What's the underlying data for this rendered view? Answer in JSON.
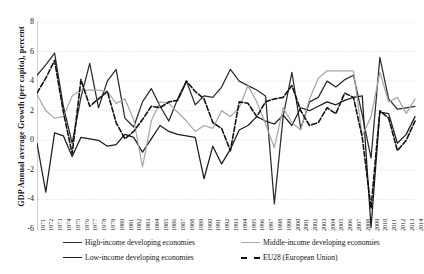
{
  "chart_data": {
    "type": "line",
    "title": "",
    "xlabel": "",
    "ylabel": "GDP Annual average Growth (per capita), percent",
    "ylim": [
      -6,
      8
    ],
    "yticks": [
      8,
      6,
      4,
      2,
      0,
      -2,
      -4,
      -6
    ],
    "grid": true,
    "legend_position": "bottom",
    "x": [
      1971,
      1972,
      1973,
      1974,
      1975,
      1976,
      1977,
      1978,
      1979,
      1980,
      1981,
      1982,
      1983,
      1984,
      1985,
      1986,
      1987,
      1988,
      1989,
      1990,
      1991,
      1992,
      1993,
      1994,
      1995,
      1996,
      1997,
      1998,
      1999,
      2000,
      2001,
      2002,
      2003,
      2004,
      2005,
      2006,
      2007,
      2008,
      2009,
      2010,
      2011,
      2012,
      2013,
      2014
    ],
    "series": [
      {
        "name": "High-income developing economies",
        "color": "#2b2b2b",
        "style": "solid",
        "values": [
          4.4,
          5.1,
          5.9,
          2.3,
          -0.2,
          2.9,
          5.2,
          2.2,
          4.0,
          4.8,
          1.5,
          0.9,
          2.6,
          3.5,
          2.3,
          1.3,
          2.8,
          4.0,
          2.4,
          3.0,
          2.9,
          3.6,
          4.8,
          4.0,
          3.7,
          3.4,
          3.0,
          -4.3,
          1.6,
          4.6,
          0.8,
          2.6,
          2.9,
          4.0,
          3.6,
          4.1,
          4.4,
          1.7,
          -1.2,
          5.6,
          2.8,
          2.1,
          2.2,
          2.3
        ]
      },
      {
        "name": "Low-income developing economies",
        "color": "#1c1c1c",
        "style": "solid",
        "values": [
          -0.2,
          -3.5,
          0.5,
          0.3,
          -1.1,
          0.2,
          0.1,
          0.0,
          -0.4,
          -0.3,
          0.4,
          0.2,
          -0.8,
          0.1,
          1.0,
          0.6,
          0.4,
          0.3,
          0.2,
          -2.6,
          -0.4,
          -1.6,
          -0.6,
          0.7,
          1.0,
          1.6,
          1.3,
          1.1,
          1.7,
          1.0,
          2.2,
          2.0,
          2.3,
          2.6,
          2.4,
          2.7,
          2.9,
          3.0,
          -5.9,
          1.9,
          1.8,
          -0.2,
          0.4,
          1.6
        ]
      },
      {
        "name": "Middle-income developing economies",
        "color": "#a8a8a8",
        "style": "solid",
        "values": [
          3.1,
          2.0,
          1.5,
          1.6,
          3.0,
          3.4,
          3.4,
          3.4,
          3.3,
          2.5,
          2.8,
          1.4,
          -1.8,
          1.3,
          2.6,
          2.5,
          1.9,
          1.3,
          0.6,
          1.0,
          0.8,
          2.0,
          1.6,
          2.2,
          3.7,
          2.6,
          1.1,
          -0.5,
          2.2,
          1.2,
          0.7,
          2.8,
          4.2,
          4.7,
          4.7,
          4.7,
          4.7,
          0.3,
          1.6,
          4.6,
          2.6,
          2.9,
          1.8,
          2.8
        ]
      },
      {
        "name": "EU28 (European Union)",
        "color": "#111111",
        "style": "dashed",
        "values": [
          3.2,
          4.2,
          5.4,
          1.9,
          -0.9,
          4.1,
          2.3,
          2.8,
          3.3,
          1.2,
          0.1,
          0.6,
          1.4,
          2.3,
          2.2,
          2.6,
          2.7,
          4.0,
          3.3,
          2.8,
          1.2,
          0.8,
          -0.7,
          2.6,
          2.5,
          1.6,
          2.6,
          2.8,
          2.9,
          3.7,
          2.0,
          1.0,
          1.2,
          2.2,
          1.8,
          3.2,
          2.9,
          0.2,
          -4.6,
          2.0,
          1.5,
          -0.7,
          0.0,
          1.3
        ]
      }
    ]
  },
  "axis": {
    "y_title": "GDP Annual average Growth (per capita), percent"
  },
  "legend": {
    "items": [
      {
        "label": "High-income developing economies"
      },
      {
        "label": "Low-income developing economies"
      },
      {
        "label": "Middle-income developing economies"
      },
      {
        "label": "EU28 (European Union)"
      }
    ]
  }
}
